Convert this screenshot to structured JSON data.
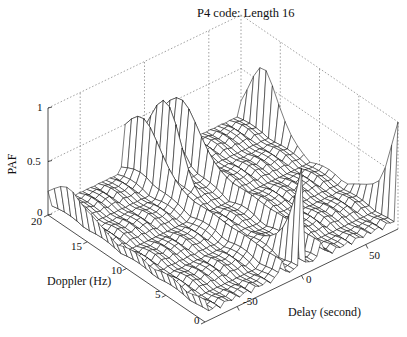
{
  "chart_data": {
    "type": "surface3d",
    "title": "P4 code: Length 16",
    "xlabel": "Delay (second)",
    "ylabel": "Doppler (Hz)",
    "zlabel": "PAF",
    "x_ticks": [
      "-50",
      "0",
      "50"
    ],
    "y_ticks": [
      "0",
      "5",
      "10",
      "15",
      "20"
    ],
    "z_ticks": [
      "0",
      "0.5",
      "1"
    ],
    "xlim": [
      -75,
      75
    ],
    "ylim": [
      0,
      20
    ],
    "zlim": [
      0,
      1
    ],
    "grid": true,
    "series": [
      {
        "name": "ridge delay -75",
        "delay": -75,
        "peak_paf": 0.3
      },
      {
        "name": "ridge delay -16",
        "delay": -16,
        "peak_paf": 0.75
      },
      {
        "name": "ridge delay 0",
        "delay": 0,
        "peak_paf": 1.0
      },
      {
        "name": "ridge delay 16",
        "delay": 16,
        "peak_paf": 0.75
      },
      {
        "name": "ridge delay 75",
        "delay": 75,
        "peak_paf": 1.0
      }
    ]
  }
}
